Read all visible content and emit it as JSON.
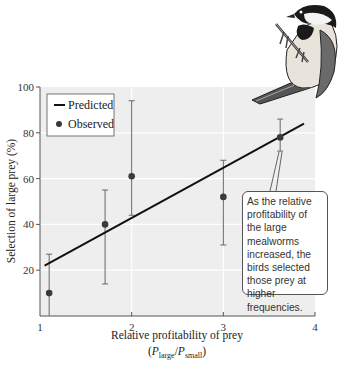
{
  "chart_data": {
    "type": "scatter",
    "title": "",
    "xlabel": "Relative profitability of prey",
    "xlabel_sub": "(P_large/P_small)",
    "ylabel": "Selection of large prey (%)",
    "xlim": [
      1,
      4
    ],
    "ylim": [
      0,
      100
    ],
    "xticks": [
      1,
      2,
      3,
      4
    ],
    "yticks": [
      20,
      40,
      60,
      80,
      100
    ],
    "grid": true,
    "legend_position": "upper left",
    "legend": [
      "Predicted",
      "Observed"
    ],
    "series": [
      {
        "name": "Predicted",
        "kind": "line",
        "x": [
          1.05,
          3.88
        ],
        "y": [
          22,
          84
        ]
      },
      {
        "name": "Observed",
        "kind": "scatter_with_error",
        "x": [
          1.1,
          1.71,
          2.0,
          3.0,
          3.62
        ],
        "y": [
          10,
          40,
          61,
          52,
          78
        ],
        "err_low": [
          0,
          14,
          44,
          31,
          72
        ],
        "err_high": [
          27,
          55,
          94,
          68,
          86
        ]
      }
    ],
    "annotations": [
      {
        "text": "As the relative profitability of the large mealworms increased, the birds selected those prey at higher frequencies.",
        "points_to": {
          "x": 3.62,
          "y": 72
        }
      }
    ]
  },
  "labels": {
    "xlabel": "Relative profitability of prey",
    "xlabel_p": "P",
    "xlabel_large": "large",
    "xlabel_slash": "/",
    "xlabel_small": "small",
    "ylabel": "Selection of large prey (%)",
    "legend_predicted": "Predicted",
    "legend_observed": "Observed",
    "callout": "As the relative profitability of the large mealworms increased, the birds selected those prey at higher frequencies.",
    "x_ticks": [
      "1",
      "2",
      "3",
      "4"
    ],
    "y_ticks": [
      "100",
      "80",
      "60",
      "40",
      "20"
    ]
  },
  "colors": {
    "plot_bg": "#eeeeee",
    "grid": "#ffffff",
    "line": "#111111",
    "point": "#3a3a3a",
    "errorbar": "#666666"
  },
  "illustration": "chickadee-bird-icon"
}
